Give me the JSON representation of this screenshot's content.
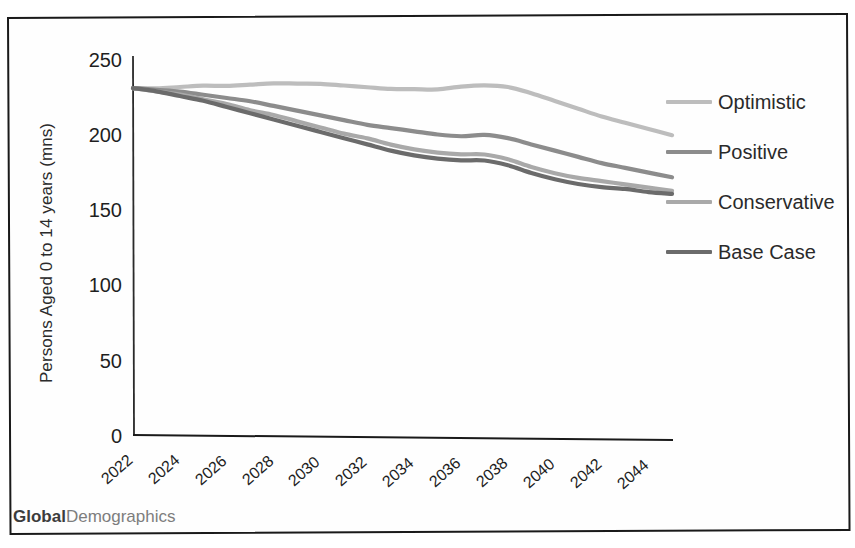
{
  "footer": {
    "brand_bold": "Global",
    "brand_light": "Demographics"
  },
  "legend": {
    "position": "right",
    "items": [
      {
        "label": "Optimistic",
        "color": "#bdbdbd"
      },
      {
        "label": "Positive",
        "color": "#8c8c8c"
      },
      {
        "label": "Conservative",
        "color": "#a9a9a9"
      },
      {
        "label": "Base Case",
        "color": "#6b6b6b"
      }
    ]
  },
  "axes": {
    "y_title": "Persons Aged 0 to 14 years (mns)",
    "y_ticks": [
      "250",
      "200",
      "150",
      "100",
      "50",
      "0"
    ],
    "x_ticks": [
      "2022",
      "2024",
      "2026",
      "2028",
      "2030",
      "2032",
      "2034",
      "2036",
      "2038",
      "2040",
      "2042",
      "2044"
    ]
  },
  "chart_data": {
    "type": "line",
    "title": "",
    "subtitle": "",
    "xlabel": "",
    "ylabel": "Persons Aged 0 to 14 years (mns)",
    "xlim": [
      2022,
      2045
    ],
    "ylim": [
      0,
      250
    ],
    "grid": false,
    "legend_position": "right",
    "x": [
      2022,
      2023,
      2024,
      2025,
      2026,
      2027,
      2028,
      2029,
      2030,
      2031,
      2032,
      2033,
      2034,
      2035,
      2036,
      2037,
      2038,
      2039,
      2040,
      2041,
      2042,
      2043,
      2044,
      2045
    ],
    "series": [
      {
        "name": "Optimistic",
        "color": "#bdbdbd",
        "values": [
          230,
          230,
          231,
          232,
          232,
          233,
          234,
          234,
          234,
          233,
          232,
          231,
          231,
          231,
          233,
          234,
          233,
          229,
          224,
          219,
          214,
          210,
          206,
          202
        ]
      },
      {
        "name": "Positive",
        "color": "#8c8c8c",
        "values": [
          230,
          229,
          228,
          226,
          224,
          222,
          219,
          216,
          213,
          210,
          207,
          205,
          203,
          201,
          200,
          201,
          199,
          195,
          191,
          187,
          183,
          180,
          177,
          174
        ]
      },
      {
        "name": "Conservative",
        "color": "#a9a9a9",
        "values": [
          230,
          228,
          226,
          223,
          220,
          216,
          213,
          209,
          205,
          201,
          198,
          194,
          191,
          189,
          188,
          188,
          185,
          180,
          176,
          173,
          171,
          169,
          167,
          165
        ]
      },
      {
        "name": "Base Case",
        "color": "#6b6b6b",
        "values": [
          230,
          228,
          225,
          222,
          218,
          214,
          210,
          206,
          202,
          198,
          194,
          190,
          187,
          185,
          184,
          184,
          181,
          176,
          172,
          169,
          167,
          166,
          164,
          163
        ]
      }
    ]
  }
}
